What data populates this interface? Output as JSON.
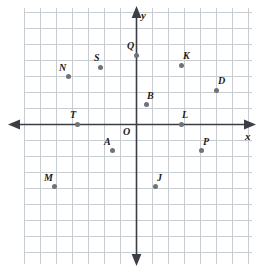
{
  "figure": {
    "kind": "coordinate-plane",
    "background_color": "#ffffff",
    "grid_color": "#c8cdd2",
    "axis_color": "#3b3f45",
    "point_color": "#6f7378",
    "label_color": "#1b1b1b"
  },
  "chart_data": {
    "type": "scatter",
    "title": "",
    "xlabel": "x",
    "ylabel": "y",
    "grid": true,
    "legend": null,
    "xlim": [
      -7,
      8
    ],
    "ylim": [
      -7,
      8
    ],
    "tick_step": 1,
    "tick_labels_shown": false,
    "origin_label": "O",
    "points": [
      {
        "label": "Q",
        "x": 0,
        "y": 4,
        "px": 136,
        "py": 55,
        "lx": 127,
        "ly": 41
      },
      {
        "label": "S",
        "x": -2,
        "y": 3,
        "px": 100,
        "py": 67,
        "lx": 94,
        "ly": 53
      },
      {
        "label": "K",
        "x": 3,
        "y": 3,
        "px": 181,
        "py": 65,
        "lx": 183,
        "ly": 51
      },
      {
        "label": "N",
        "x": -4,
        "y": 2,
        "px": 68,
        "py": 76,
        "lx": 59,
        "ly": 63
      },
      {
        "label": "D",
        "x": 5,
        "y": 2,
        "px": 216,
        "py": 90,
        "lx": 218,
        "ly": 76
      },
      {
        "label": "B",
        "x": 1,
        "y": 1,
        "px": 146,
        "py": 104,
        "lx": 147,
        "ly": 91
      },
      {
        "label": "T",
        "x": -4,
        "y": 0,
        "px": 77,
        "py": 124,
        "lx": 70,
        "ly": 110
      },
      {
        "label": "L",
        "x": 3,
        "y": 0,
        "px": 181,
        "py": 124,
        "lx": 182,
        "ly": 110
      },
      {
        "label": "A",
        "x": -2,
        "y": -2,
        "px": 112,
        "py": 150,
        "lx": 104,
        "ly": 137
      },
      {
        "label": "P",
        "x": 4,
        "y": -2,
        "px": 201,
        "py": 150,
        "lx": 203,
        "ly": 137
      },
      {
        "label": "M",
        "x": -5,
        "y": -4,
        "px": 54,
        "py": 186,
        "lx": 44,
        "ly": 173
      },
      {
        "label": "J",
        "x": 1,
        "y": -4,
        "px": 155,
        "py": 186,
        "lx": 157,
        "ly": 173
      }
    ],
    "axis_annotations": [
      {
        "name": "x-axis-label",
        "text": "x",
        "lx": 245,
        "ly": 131
      },
      {
        "name": "y-axis-label",
        "text": "y",
        "lx": 141,
        "ly": 10
      }
    ]
  }
}
